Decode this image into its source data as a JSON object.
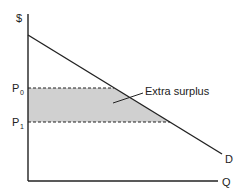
{
  "diagram": {
    "type": "demand-surplus",
    "y_axis_label": "$",
    "x_axis_label": "Q",
    "curve_label": "D",
    "price_labels": [
      {
        "base": "P",
        "sub": "0"
      },
      {
        "base": "P",
        "sub": "1"
      }
    ],
    "annotation": "Extra surplus",
    "colors": {
      "line": "#222222",
      "shade": "#c8c8c8"
    }
  }
}
